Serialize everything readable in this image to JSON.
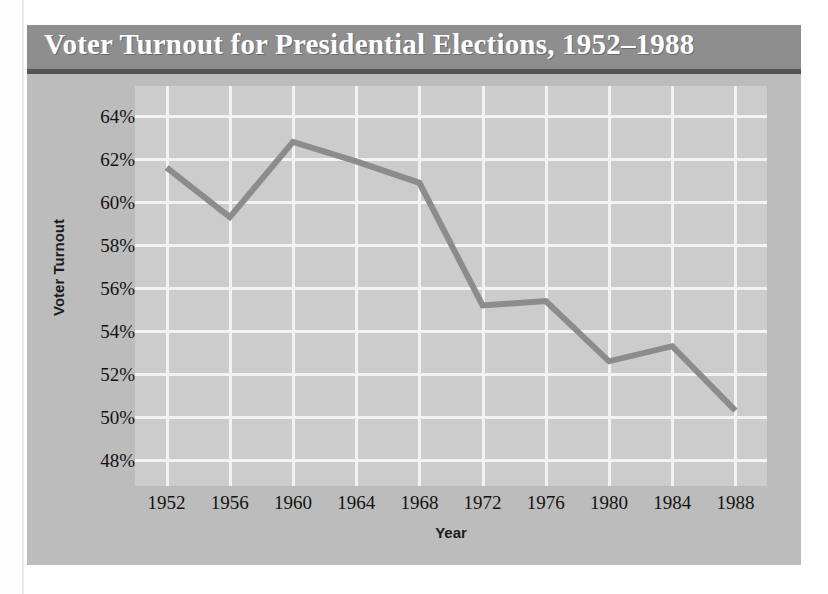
{
  "figure": {
    "title": "Voter Turnout for Presidential Elections, 1952–1988",
    "title_bar_color": "#8e8e8e",
    "title_text_color": "#ffffff",
    "panel_color": "#bcbcbc",
    "plot_color": "#cccccc",
    "gridline_color": "#f2f2f2",
    "line_color": "#8c8c8c"
  },
  "chart_data": {
    "type": "line",
    "title": "Voter Turnout for Presidential Elections, 1952–1988",
    "xlabel": "Year",
    "ylabel": "Voter Turnout",
    "x": [
      1952,
      1956,
      1960,
      1964,
      1968,
      1972,
      1976,
      1980,
      1984,
      1988
    ],
    "xtick_labels": [
      "1952",
      "1956",
      "1960",
      "1964",
      "1968",
      "1972",
      "1976",
      "1980",
      "1984",
      "1988"
    ],
    "values": [
      61.6,
      59.3,
      62.8,
      61.9,
      60.9,
      55.2,
      55.4,
      52.6,
      53.3,
      50.3
    ],
    "ytick_values": [
      64,
      62,
      60,
      58,
      56,
      54,
      52,
      50,
      48
    ],
    "ytick_labels": [
      "64%",
      "62%",
      "60%",
      "58%",
      "56%",
      "54%",
      "52%",
      "50%",
      "48%"
    ],
    "ylim": [
      46.8,
      65.4
    ],
    "xlim": [
      1950,
      1990
    ],
    "grid": true,
    "legend": false,
    "series_name": "Voter Turnout"
  }
}
